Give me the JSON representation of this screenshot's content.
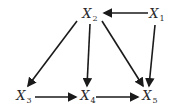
{
  "diagram": {
    "type": "directed-graph",
    "colors": {
      "edge": "#1a1a1a",
      "label": "#2a2a2a",
      "background": "#ffffff"
    },
    "nodes": [
      {
        "id": "X1",
        "base": "X",
        "sub": "1",
        "x": 157,
        "y": 15
      },
      {
        "id": "X2",
        "base": "X",
        "sub": "2",
        "x": 90,
        "y": 15
      },
      {
        "id": "X3",
        "base": "X",
        "sub": "3",
        "x": 24,
        "y": 97
      },
      {
        "id": "X4",
        "base": "X",
        "sub": "4",
        "x": 88,
        "y": 97
      },
      {
        "id": "X5",
        "base": "X",
        "sub": "5",
        "x": 150,
        "y": 97
      }
    ],
    "edges": [
      {
        "from": "X1",
        "to": "X2",
        "x1": 148,
        "y1": 13,
        "x2": 104,
        "y2": 13
      },
      {
        "from": "X1",
        "to": "X5",
        "x1": 155,
        "y1": 25,
        "x2": 149,
        "y2": 86
      },
      {
        "from": "X2",
        "to": "X3",
        "x1": 77,
        "y1": 21,
        "x2": 28,
        "y2": 86
      },
      {
        "from": "X2",
        "to": "X4",
        "x1": 90,
        "y1": 24,
        "x2": 87,
        "y2": 86
      },
      {
        "from": "X2",
        "to": "X5",
        "x1": 102,
        "y1": 21,
        "x2": 143,
        "y2": 86
      },
      {
        "from": "X3",
        "to": "X4",
        "x1": 35,
        "y1": 97,
        "x2": 76,
        "y2": 97
      },
      {
        "from": "X4",
        "to": "X5",
        "x1": 96,
        "y1": 97,
        "x2": 138,
        "y2": 97
      }
    ]
  }
}
